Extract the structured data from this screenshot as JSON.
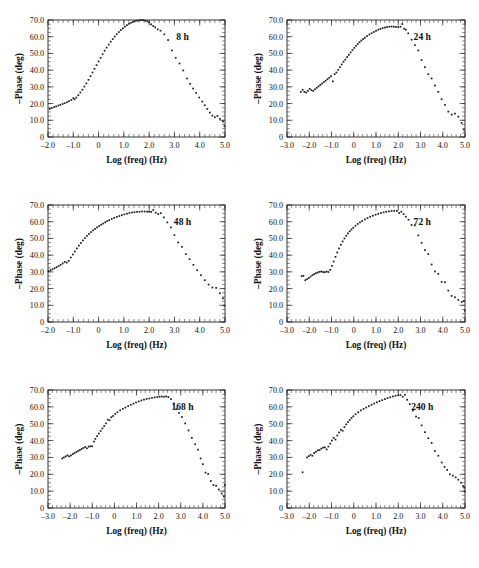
{
  "figure": {
    "name": "bode-phase-multipanel",
    "panel_count": 6,
    "marker_color": "#1b1b1b",
    "axis_color": "#222222",
    "background": "#ffffff"
  },
  "chart_data": [
    {
      "type": "scatter",
      "title": "8 h",
      "annotation": "8 h",
      "xlabel": "Log (freq) (Hz)",
      "ylabel": "–Phase (deg)",
      "xlim": [
        -2.0,
        5.0
      ],
      "ylim": [
        0,
        70.0
      ],
      "xticks": [
        -2.0,
        -1.0,
        0,
        1.0,
        2.0,
        3.0,
        4.0,
        5.0
      ],
      "xticklabels": [
        "–2.0",
        "–1.0",
        "0",
        "1.0",
        "2.0",
        "3.0",
        "4.0",
        "5.0"
      ],
      "yticks": [
        0,
        10.0,
        20.0,
        30.0,
        40.0,
        50.0,
        60.0,
        70.0
      ],
      "yticklabels": [
        "0",
        "10.0",
        "20.0",
        "30.0",
        "40.0",
        "50.0",
        "60.0",
        "70.0"
      ],
      "grid": false,
      "legend": "none",
      "x": [
        -1.93,
        -1.85,
        -1.76,
        -1.68,
        -1.59,
        -1.51,
        -1.42,
        -1.34,
        -1.25,
        -1.17,
        -1.08,
        -1.0,
        -0.95,
        -0.88,
        -0.8,
        -0.72,
        -0.64,
        -0.56,
        -0.48,
        -0.4,
        -0.32,
        -0.24,
        -0.16,
        -0.08,
        0.0,
        0.08,
        0.16,
        0.24,
        0.32,
        0.4,
        0.48,
        0.56,
        0.64,
        0.72,
        0.8,
        0.88,
        0.96,
        1.04,
        1.12,
        1.2,
        1.28,
        1.36,
        1.44,
        1.52,
        1.6,
        1.68,
        1.76,
        1.84,
        1.92,
        2.0,
        2.08,
        2.16,
        2.24,
        2.34,
        2.45,
        2.6,
        2.75,
        2.9,
        3.05,
        3.2,
        3.35,
        3.5,
        3.62,
        3.74,
        3.86,
        3.98,
        4.1,
        4.2,
        4.3,
        4.4,
        4.5,
        4.6,
        4.7,
        4.8,
        4.92,
        4.98
      ],
      "y": [
        16.8,
        17.4,
        17.9,
        18.3,
        18.8,
        19.3,
        19.8,
        20.2,
        20.8,
        21.4,
        22.1,
        23.2,
        22.6,
        23.6,
        25.0,
        26.6,
        28.3,
        30.2,
        32.1,
        34.2,
        36.4,
        38.6,
        40.8,
        43.0,
        45.2,
        47.4,
        49.5,
        51.6,
        53.5,
        55.3,
        57.0,
        58.6,
        60.1,
        61.5,
        62.8,
        64.0,
        65.0,
        66.0,
        66.9,
        67.7,
        68.3,
        68.9,
        69.3,
        69.6,
        69.8,
        69.9,
        69.9,
        69.6,
        69.2,
        68.6,
        67.4,
        66.4,
        65.6,
        64.4,
        63.6,
        61.4,
        58.0,
        51.8,
        47.4,
        44.0,
        39.8,
        35.0,
        31.8,
        29.0,
        26.4,
        23.6,
        21.2,
        19.0,
        16.8,
        14.6,
        12.8,
        11.8,
        12.6,
        10.8,
        9.2,
        6.4
      ]
    },
    {
      "type": "scatter",
      "title": "24 h",
      "annotation": "24 h",
      "xlabel": "Log (freq) (Hz)",
      "ylabel": "–Phase (deg)",
      "xlim": [
        -3.0,
        5.0
      ],
      "ylim": [
        0,
        70.0
      ],
      "xticks": [
        -3.0,
        -2.0,
        -1.0,
        0,
        1.0,
        2.0,
        3.0,
        4.0,
        5.0
      ],
      "xticklabels": [
        "–3.0",
        "–2.0",
        "–1.0",
        "0",
        "1.0",
        "2.0",
        "3.0",
        "4.0",
        "5.0"
      ],
      "yticks": [
        0,
        10.0,
        20.0,
        30.0,
        40.0,
        50.0,
        60.0,
        70.0
      ],
      "yticklabels": [
        "0",
        "10.0",
        "20.0",
        "30.0",
        "40.0",
        "50.0",
        "60.0",
        "70.0"
      ],
      "grid": false,
      "legend": "none",
      "x": [
        -2.38,
        -2.3,
        -2.22,
        -2.14,
        -2.06,
        -1.98,
        -1.9,
        -1.82,
        -1.74,
        -1.66,
        -1.58,
        -1.5,
        -1.42,
        -1.34,
        -1.26,
        -1.18,
        -1.1,
        -1.02,
        -0.94,
        -0.86,
        -0.78,
        -0.7,
        -0.62,
        -0.54,
        -0.46,
        -0.38,
        -0.3,
        -0.22,
        -0.14,
        -0.06,
        0.02,
        0.1,
        0.18,
        0.26,
        0.34,
        0.42,
        0.5,
        0.6,
        0.7,
        0.8,
        0.9,
        1.0,
        1.1,
        1.2,
        1.3,
        1.4,
        1.5,
        1.6,
        1.7,
        1.8,
        1.9,
        2.0,
        2.1,
        2.18,
        2.26,
        2.34,
        2.45,
        2.6,
        2.75,
        2.9,
        3.05,
        3.2,
        3.35,
        3.5,
        3.65,
        3.8,
        3.95,
        4.1,
        4.25,
        4.4,
        4.55,
        4.7,
        4.85,
        4.95
      ],
      "y": [
        27.0,
        28.2,
        27.0,
        26.6,
        27.6,
        28.8,
        28.0,
        27.6,
        28.6,
        29.5,
        30.3,
        31.2,
        32.0,
        32.9,
        33.7,
        34.6,
        35.4,
        36.4,
        33.3,
        37.6,
        38.6,
        40.2,
        41.8,
        43.4,
        45.0,
        46.3,
        47.8,
        49.2,
        50.6,
        52.0,
        53.3,
        54.5,
        55.6,
        56.7,
        57.7,
        58.6,
        59.4,
        60.4,
        61.3,
        62.1,
        62.8,
        63.5,
        64.2,
        64.7,
        65.2,
        65.5,
        65.8,
        66.0,
        66.1,
        66.0,
        65.9,
        65.7,
        66.0,
        67.6,
        64.8,
        64.2,
        62.0,
        58.2,
        55.0,
        51.8,
        46.0,
        41.8,
        37.6,
        35.0,
        30.8,
        27.0,
        22.6,
        19.2,
        15.2,
        13.4,
        14.0,
        12.2,
        8.4,
        4.4
      ]
    },
    {
      "type": "scatter",
      "title": "48 h",
      "annotation": "48 h",
      "xlabel": "Log (freq) (Hz)",
      "ylabel": "–Phase (deg)",
      "xlim": [
        -2.0,
        5.0
      ],
      "ylim": [
        0,
        70.0
      ],
      "xticks": [
        -2.0,
        -1.0,
        0,
        1.0,
        2.0,
        3.0,
        4.0,
        5.0
      ],
      "xticklabels": [
        "–2.0",
        "–1.0",
        "0",
        "1.0",
        "2.0",
        "3.0",
        "4.0",
        "5.0"
      ],
      "yticks": [
        0,
        10.0,
        20.0,
        30.0,
        40.0,
        50.0,
        60.0,
        70.0
      ],
      "yticklabels": [
        "0",
        "10.0",
        "20.0",
        "30.0",
        "40.0",
        "50.0",
        "60.0",
        "70.0"
      ],
      "grid": false,
      "legend": "none",
      "x": [
        -1.98,
        -1.9,
        -1.82,
        -1.74,
        -1.66,
        -1.58,
        -1.5,
        -1.42,
        -1.34,
        -1.26,
        -1.18,
        -1.1,
        -1.02,
        -0.94,
        -0.86,
        -0.78,
        -0.7,
        -0.62,
        -0.54,
        -0.46,
        -0.38,
        -0.3,
        -0.22,
        -0.14,
        -0.06,
        0.02,
        0.1,
        0.18,
        0.26,
        0.34,
        0.42,
        0.52,
        0.62,
        0.72,
        0.82,
        0.92,
        1.02,
        1.12,
        1.22,
        1.32,
        1.42,
        1.52,
        1.62,
        1.72,
        1.82,
        1.92,
        2.0,
        2.08,
        2.16,
        2.26,
        2.36,
        2.46,
        2.58,
        2.72,
        2.86,
        3.0,
        3.15,
        3.3,
        3.45,
        3.6,
        3.75,
        3.9,
        4.05,
        4.2,
        4.35,
        4.5,
        4.65,
        4.8,
        4.92,
        4.98
      ],
      "y": [
        30.5,
        31.0,
        31.6,
        32.2,
        32.8,
        33.5,
        34.2,
        35.0,
        36.0,
        35.6,
        36.6,
        38.6,
        40.4,
        42.2,
        44.0,
        45.7,
        47.3,
        48.8,
        50.2,
        51.5,
        52.7,
        53.8,
        54.8,
        55.7,
        56.6,
        57.4,
        58.2,
        58.9,
        59.6,
        60.3,
        60.9,
        61.6,
        62.3,
        62.9,
        63.4,
        63.9,
        64.4,
        64.8,
        65.2,
        65.5,
        65.7,
        65.9,
        66.0,
        66.1,
        66.1,
        66.0,
        66.0,
        65.9,
        67.0,
        65.4,
        64.6,
        65.1,
        62.6,
        59.6,
        56.6,
        52.0,
        47.6,
        45.0,
        40.6,
        37.6,
        34.2,
        31.0,
        28.0,
        25.0,
        22.4,
        20.6,
        20.4,
        17.2,
        14.2,
        9.8
      ]
    },
    {
      "type": "scatter",
      "title": "72 h",
      "annotation": "72 h",
      "xlabel": "Log (freq) (Hz)",
      "ylabel": "–Phase (deg)",
      "xlim": [
        -3.0,
        5.0
      ],
      "ylim": [
        0,
        70.0
      ],
      "xticks": [
        -3.0,
        -2.0,
        -1.0,
        0,
        1.0,
        2.0,
        3.0,
        4.0,
        5.0
      ],
      "xticklabels": [
        "–3.0",
        "–2.0",
        "–1.0",
        "0",
        "1.0",
        "2.0",
        "3.0",
        "4.0",
        "5.0"
      ],
      "yticks": [
        0,
        10.0,
        20.0,
        30.0,
        40.0,
        50.0,
        60.0,
        70.0
      ],
      "yticklabels": [
        "0",
        "10.0",
        "20.0",
        "30.0",
        "40.0",
        "50.0",
        "60.0",
        "70.0"
      ],
      "grid": false,
      "legend": "none",
      "x": [
        -2.34,
        -2.26,
        -2.18,
        -2.1,
        -2.02,
        -1.94,
        -1.86,
        -1.78,
        -1.7,
        -1.62,
        -1.54,
        -1.46,
        -1.38,
        -1.3,
        -1.22,
        -1.14,
        -1.06,
        -0.98,
        -0.9,
        -0.82,
        -0.74,
        -0.66,
        -0.58,
        -0.5,
        -0.42,
        -0.34,
        -0.26,
        -0.18,
        -0.1,
        -0.02,
        0.08,
        0.18,
        0.28,
        0.38,
        0.5,
        0.62,
        0.74,
        0.86,
        0.98,
        1.1,
        1.22,
        1.34,
        1.46,
        1.58,
        1.7,
        1.82,
        1.94,
        2.04,
        2.14,
        2.24,
        2.34,
        2.46,
        2.6,
        2.74,
        2.9,
        3.05,
        3.2,
        3.35,
        3.5,
        3.65,
        3.8,
        3.95,
        4.1,
        4.25,
        4.4,
        4.55,
        4.7,
        4.85,
        4.95,
        4.99
      ],
      "y": [
        27.4,
        27.6,
        25.0,
        25.6,
        26.3,
        27.2,
        28.0,
        28.6,
        29.2,
        29.6,
        30.0,
        30.2,
        29.9,
        29.8,
        30.2,
        29.9,
        31.2,
        33.6,
        36.2,
        39.0,
        41.6,
        44.0,
        46.2,
        48.2,
        50.0,
        51.6,
        53.0,
        54.3,
        55.4,
        56.4,
        57.6,
        58.7,
        59.6,
        60.4,
        61.4,
        62.2,
        63.0,
        63.6,
        64.2,
        64.7,
        65.2,
        65.6,
        65.9,
        66.2,
        66.4,
        66.5,
        66.5,
        65.2,
        66.0,
        64.6,
        63.0,
        61.2,
        58.0,
        57.8,
        51.8,
        47.4,
        43.0,
        40.6,
        34.4,
        30.2,
        28.8,
        24.0,
        23.8,
        18.8,
        15.6,
        14.8,
        13.2,
        12.0,
        12.6,
        6.8
      ]
    },
    {
      "type": "scatter",
      "title": "168 h",
      "annotation": "168 h",
      "xlabel": "Log (freq) (Hz)",
      "ylabel": "–Phase (deg)",
      "xlim": [
        -3.0,
        5.0
      ],
      "ylim": [
        0,
        70.0
      ],
      "xticks": [
        -3.0,
        -2.0,
        -1.0,
        0,
        1.0,
        2.0,
        3.0,
        4.0,
        5.0
      ],
      "xticklabels": [
        "–3.0",
        "–2.0",
        "–1.0",
        "0",
        "1.0",
        "2.0",
        "3.0",
        "4.0",
        "5.0"
      ],
      "yticks": [
        0,
        10.0,
        20.0,
        30.0,
        40.0,
        50.0,
        60.0,
        70.0
      ],
      "yticklabels": [
        "0",
        "10.0",
        "20.0",
        "30.0",
        "40.0",
        "50.0",
        "60.0",
        "70.0"
      ],
      "grid": false,
      "legend": "none",
      "x": [
        -2.36,
        -2.28,
        -2.2,
        -2.12,
        -2.04,
        -1.96,
        -1.88,
        -1.8,
        -1.72,
        -1.64,
        -1.56,
        -1.48,
        -1.4,
        -1.32,
        -1.24,
        -1.16,
        -1.08,
        -1.0,
        -0.92,
        -0.86,
        -0.78,
        -0.7,
        -0.62,
        -0.54,
        -0.46,
        -0.38,
        -0.3,
        -0.22,
        -0.14,
        -0.06,
        0.04,
        0.14,
        0.26,
        0.38,
        0.5,
        0.62,
        0.74,
        0.86,
        0.98,
        1.1,
        1.22,
        1.34,
        1.46,
        1.58,
        1.7,
        1.82,
        1.94,
        2.04,
        2.14,
        2.24,
        2.34,
        2.44,
        2.56,
        2.68,
        2.8,
        2.92,
        3.05,
        3.2,
        3.35,
        3.5,
        3.65,
        3.78,
        3.9,
        4.0,
        4.12,
        4.24,
        4.36,
        4.48,
        4.6,
        4.72,
        4.85,
        4.95,
        4.99
      ],
      "y": [
        29.4,
        30.0,
        30.6,
        31.2,
        30.6,
        31.2,
        32.0,
        32.6,
        33.2,
        33.8,
        34.4,
        35.0,
        35.6,
        36.2,
        35.4,
        36.4,
        36.6,
        36.6,
        39.4,
        41.0,
        42.6,
        44.2,
        45.7,
        47.2,
        48.6,
        50.2,
        52.4,
        52.0,
        53.8,
        54.6,
        55.8,
        56.8,
        57.9,
        58.8,
        59.6,
        60.4,
        61.2,
        61.9,
        62.6,
        63.2,
        63.8,
        64.3,
        64.7,
        65.0,
        65.3,
        65.6,
        65.8,
        66.0,
        66.1,
        66.0,
        66.2,
        65.8,
        64.6,
        62.0,
        58.6,
        56.4,
        54.0,
        50.2,
        46.0,
        41.6,
        37.8,
        34.6,
        29.4,
        26.0,
        21.0,
        20.2,
        16.0,
        13.6,
        13.2,
        11.0,
        8.6,
        6.8,
        13.6
      ]
    },
    {
      "type": "scatter",
      "title": "240 h",
      "annotation": "240 h",
      "xlabel": "Log (freq) (Hz)",
      "ylabel": "–Phase (deg)",
      "xlim": [
        -3.0,
        5.0
      ],
      "ylim": [
        0,
        70.0
      ],
      "xticks": [
        -3.0,
        -2.0,
        -1.0,
        0,
        1.0,
        2.0,
        3.0,
        4.0,
        5.0
      ],
      "xticklabels": [
        "–3.0",
        "–2.0",
        "–1.0",
        "0",
        "1.0",
        "2.0",
        "3.0",
        "4.0",
        "5.0"
      ],
      "yticks": [
        0,
        10.0,
        20.0,
        30.0,
        40.0,
        50.0,
        60.0,
        70.0
      ],
      "yticklabels": [
        "0",
        "10.0",
        "20.0",
        "30.0",
        "40.0",
        "50.0",
        "60.0",
        "70.0"
      ],
      "grid": false,
      "legend": "none",
      "x": [
        -2.3,
        -2.1,
        -2.02,
        -1.94,
        -1.86,
        -1.78,
        -1.7,
        -1.62,
        -1.54,
        -1.46,
        -1.38,
        -1.3,
        -1.22,
        -1.14,
        -1.06,
        -0.98,
        -0.9,
        -0.82,
        -0.74,
        -0.66,
        -0.58,
        -0.5,
        -0.42,
        -0.34,
        -0.26,
        -0.18,
        -0.1,
        -0.02,
        0.08,
        0.2,
        0.32,
        0.44,
        0.56,
        0.68,
        0.8,
        0.92,
        1.04,
        1.16,
        1.28,
        1.4,
        1.52,
        1.64,
        1.76,
        1.88,
        2.0,
        2.1,
        2.2,
        2.3,
        2.4,
        2.52,
        2.66,
        2.8,
        2.92,
        3.05,
        3.2,
        3.35,
        3.5,
        3.65,
        3.8,
        3.95,
        4.08,
        4.2,
        4.32,
        4.45,
        4.58,
        4.7,
        4.82,
        4.92,
        4.97,
        4.99
      ],
      "y": [
        21.2,
        30.0,
        30.8,
        31.6,
        31.0,
        32.6,
        33.4,
        34.2,
        34.4,
        35.2,
        35.8,
        36.0,
        34.8,
        36.4,
        38.2,
        40.0,
        41.6,
        40.6,
        43.0,
        44.8,
        46.4,
        45.8,
        48.0,
        49.6,
        51.0,
        52.2,
        53.4,
        54.4,
        55.6,
        56.8,
        57.9,
        58.8,
        59.6,
        60.4,
        61.2,
        62.0,
        62.7,
        63.4,
        64.0,
        64.6,
        65.2,
        65.7,
        66.2,
        66.6,
        66.9,
        67.0,
        66.0,
        67.2,
        64.2,
        61.6,
        57.8,
        54.2,
        53.4,
        49.0,
        45.0,
        41.4,
        38.6,
        33.8,
        31.0,
        27.0,
        24.4,
        22.6,
        20.0,
        19.2,
        18.2,
        16.8,
        15.0,
        13.0,
        12.0,
        9.8
      ]
    }
  ]
}
